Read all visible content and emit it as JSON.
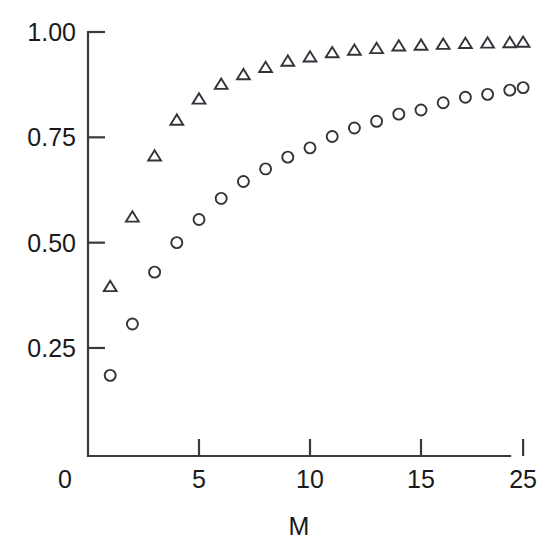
{
  "chart_data": {
    "type": "scatter",
    "title": "",
    "subtitle": "",
    "xlabel": "M",
    "ylabel": "",
    "grid": false,
    "legend": "none",
    "xlim": [
      0,
      20.6
    ],
    "ylim": [
      0.0,
      1.06
    ],
    "x_ticks": [
      {
        "value": 0,
        "label": "0"
      },
      {
        "value": 5,
        "label": "5"
      },
      {
        "value": 10,
        "label": "10"
      },
      {
        "value": 15,
        "label": "15"
      },
      {
        "value": 19.6,
        "label": "25"
      }
    ],
    "y_ticks": [
      {
        "value": 1.0,
        "label": "1.00"
      },
      {
        "value": 0.75,
        "label": "0.75"
      },
      {
        "value": 0.5,
        "label": "0.50"
      },
      {
        "value": 0.25,
        "label": "0.25"
      }
    ],
    "x": [
      1.0,
      2.0,
      3.0,
      4.0,
      5.0,
      6.0,
      7.0,
      8.0,
      9.0,
      10.0,
      11.0,
      12.0,
      13.0,
      14.0,
      15.0,
      16.0,
      17.0,
      18.0,
      19.0,
      19.6
    ],
    "series": [
      {
        "name": "triangles",
        "marker": "triangle",
        "color": "#33333a",
        "values": [
          0.395,
          0.56,
          0.705,
          0.79,
          0.84,
          0.875,
          0.898,
          0.915,
          0.93,
          0.94,
          0.95,
          0.956,
          0.96,
          0.966,
          0.968,
          0.97,
          0.972,
          0.973,
          0.974,
          0.975
        ]
      },
      {
        "name": "circles",
        "marker": "circle",
        "color": "#33333a",
        "values": [
          0.185,
          0.307,
          0.43,
          0.5,
          0.555,
          0.605,
          0.645,
          0.675,
          0.703,
          0.725,
          0.752,
          0.772,
          0.788,
          0.805,
          0.815,
          0.832,
          0.845,
          0.852,
          0.862,
          0.868
        ]
      }
    ]
  },
  "geometry": {
    "x_pixel_zero": 88,
    "x_pixel_per_unit": 22.2,
    "y_pixel_one": 32,
    "y_pixel_per_unit": 421.3,
    "axis_right": 510,
    "axis_bottom": 456,
    "tick_len": 17,
    "marker_size": 11
  }
}
